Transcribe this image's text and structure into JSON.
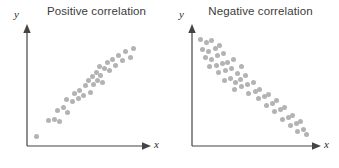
{
  "figure": {
    "background_color": "#ffffff",
    "dot_color": "#b3b3b3",
    "axis_color": "#444444"
  },
  "panels": [
    {
      "id": "positive",
      "title": "Positive correlation",
      "y_axis_label": "y",
      "x_axis_label": "x"
    },
    {
      "id": "negative",
      "title": "Negative correlation",
      "y_axis_label": "y",
      "x_axis_label": "x"
    }
  ],
  "chart_data": [
    {
      "type": "scatter",
      "title": "Positive correlation",
      "xlabel": "x",
      "ylabel": "y",
      "grid": false,
      "legend": "none",
      "xlim": [
        0,
        100
      ],
      "ylim": [
        0,
        100
      ],
      "axis_ticks": [],
      "marker": {
        "shape": "circle",
        "color": "#b3b3b3",
        "size": 5
      },
      "points": [
        {
          "x": 6,
          "y": 5
        },
        {
          "x": 17,
          "y": 20
        },
        {
          "x": 22,
          "y": 21
        },
        {
          "x": 27,
          "y": 19
        },
        {
          "x": 25,
          "y": 30
        },
        {
          "x": 30,
          "y": 33
        },
        {
          "x": 34,
          "y": 28
        },
        {
          "x": 33,
          "y": 40
        },
        {
          "x": 39,
          "y": 38
        },
        {
          "x": 40,
          "y": 46
        },
        {
          "x": 44,
          "y": 41
        },
        {
          "x": 45,
          "y": 49
        },
        {
          "x": 49,
          "y": 44
        },
        {
          "x": 50,
          "y": 53
        },
        {
          "x": 53,
          "y": 58
        },
        {
          "x": 55,
          "y": 47
        },
        {
          "x": 57,
          "y": 62
        },
        {
          "x": 58,
          "y": 54
        },
        {
          "x": 60,
          "y": 66
        },
        {
          "x": 61,
          "y": 58
        },
        {
          "x": 63,
          "y": 71
        },
        {
          "x": 64,
          "y": 63
        },
        {
          "x": 66,
          "y": 56
        },
        {
          "x": 68,
          "y": 69
        },
        {
          "x": 70,
          "y": 75
        },
        {
          "x": 72,
          "y": 67
        },
        {
          "x": 75,
          "y": 78
        },
        {
          "x": 78,
          "y": 72
        },
        {
          "x": 80,
          "y": 82
        },
        {
          "x": 84,
          "y": 77
        },
        {
          "x": 87,
          "y": 85
        },
        {
          "x": 91,
          "y": 80
        },
        {
          "x": 94,
          "y": 88
        }
      ]
    },
    {
      "type": "scatter",
      "title": "Negative correlation",
      "xlabel": "x",
      "ylabel": "y",
      "grid": false,
      "legend": "none",
      "xlim": [
        0,
        100
      ],
      "ylim": [
        0,
        100
      ],
      "axis_ticks": [],
      "marker": {
        "shape": "circle",
        "color": "#b3b3b3",
        "size": 5
      },
      "points": [
        {
          "x": 4,
          "y": 95
        },
        {
          "x": 9,
          "y": 92
        },
        {
          "x": 14,
          "y": 94
        },
        {
          "x": 6,
          "y": 86
        },
        {
          "x": 11,
          "y": 84
        },
        {
          "x": 17,
          "y": 87
        },
        {
          "x": 21,
          "y": 89
        },
        {
          "x": 8,
          "y": 78
        },
        {
          "x": 14,
          "y": 76
        },
        {
          "x": 19,
          "y": 80
        },
        {
          "x": 24,
          "y": 82
        },
        {
          "x": 12,
          "y": 70
        },
        {
          "x": 18,
          "y": 71
        },
        {
          "x": 23,
          "y": 73
        },
        {
          "x": 28,
          "y": 74
        },
        {
          "x": 33,
          "y": 76
        },
        {
          "x": 20,
          "y": 64
        },
        {
          "x": 26,
          "y": 66
        },
        {
          "x": 31,
          "y": 68
        },
        {
          "x": 36,
          "y": 63
        },
        {
          "x": 40,
          "y": 70
        },
        {
          "x": 25,
          "y": 57
        },
        {
          "x": 30,
          "y": 59
        },
        {
          "x": 35,
          "y": 55
        },
        {
          "x": 39,
          "y": 58
        },
        {
          "x": 43,
          "y": 62
        },
        {
          "x": 34,
          "y": 49
        },
        {
          "x": 40,
          "y": 51
        },
        {
          "x": 45,
          "y": 53
        },
        {
          "x": 50,
          "y": 55
        },
        {
          "x": 46,
          "y": 45
        },
        {
          "x": 52,
          "y": 47
        },
        {
          "x": 56,
          "y": 49
        },
        {
          "x": 55,
          "y": 40
        },
        {
          "x": 60,
          "y": 42
        },
        {
          "x": 64,
          "y": 44
        },
        {
          "x": 62,
          "y": 34
        },
        {
          "x": 67,
          "y": 36
        },
        {
          "x": 71,
          "y": 38
        },
        {
          "x": 69,
          "y": 28
        },
        {
          "x": 74,
          "y": 30
        },
        {
          "x": 78,
          "y": 32
        },
        {
          "x": 76,
          "y": 21
        },
        {
          "x": 81,
          "y": 23
        },
        {
          "x": 85,
          "y": 25
        },
        {
          "x": 83,
          "y": 15
        },
        {
          "x": 88,
          "y": 17
        },
        {
          "x": 92,
          "y": 19
        },
        {
          "x": 89,
          "y": 10
        },
        {
          "x": 94,
          "y": 12
        },
        {
          "x": 97,
          "y": 7
        }
      ]
    }
  ]
}
